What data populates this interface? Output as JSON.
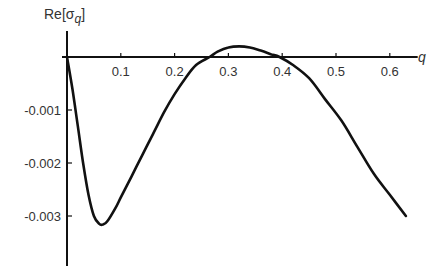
{
  "chart_data": {
    "type": "line",
    "title": "",
    "xlabel": "q",
    "ylabel": "Re[σq]",
    "ylabel_parts": {
      "prefix": "Re[σ",
      "subscript": "q",
      "suffix": "]"
    },
    "x_ticks": [
      0.1,
      0.2,
      0.3,
      0.4,
      0.5,
      0.6
    ],
    "x_tick_labels": [
      "0.1",
      "0.2",
      "0.3",
      "0.4",
      "0.5",
      "0.6"
    ],
    "y_ticks": [
      -0.001,
      -0.002,
      -0.003
    ],
    "y_tick_labels": [
      "-0.001",
      "-0.002",
      "-0.003"
    ],
    "xlim": [
      0,
      0.65
    ],
    "ylim": [
      -0.0038,
      0.0006
    ],
    "grid": false,
    "legend": null,
    "series": [
      {
        "name": "Re[σq]",
        "color": "#111111",
        "x": [
          0.0,
          0.01,
          0.02,
          0.03,
          0.04,
          0.05,
          0.06,
          0.067,
          0.075,
          0.09,
          0.1,
          0.12,
          0.14,
          0.16,
          0.18,
          0.2,
          0.22,
          0.24,
          0.265,
          0.28,
          0.3,
          0.32,
          0.34,
          0.36,
          0.38,
          0.395,
          0.42,
          0.45,
          0.48,
          0.51,
          0.54,
          0.57,
          0.6,
          0.63
        ],
        "y": [
          0.0,
          -0.0006,
          -0.0013,
          -0.002,
          -0.0026,
          -0.003,
          -0.00315,
          -0.00316,
          -0.0031,
          -0.00285,
          -0.00265,
          -0.00225,
          -0.00185,
          -0.00145,
          -0.00105,
          -0.0007,
          -0.0004,
          -0.00015,
          0.0,
          0.0001,
          0.00018,
          0.0002,
          0.00018,
          0.00012,
          5e-05,
          0.0,
          -0.00015,
          -0.0004,
          -0.0008,
          -0.0012,
          -0.0017,
          -0.0022,
          -0.0026,
          -0.003
        ]
      }
    ]
  }
}
